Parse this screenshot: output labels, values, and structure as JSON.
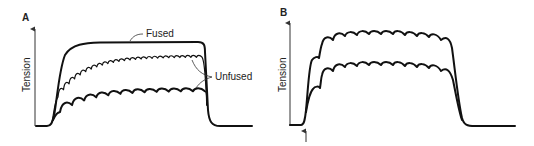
{
  "figure": {
    "panels": [
      {
        "id": "A",
        "label": "A",
        "ylabel": "Tension",
        "annotations": [
          "Fused",
          "Unfused"
        ]
      },
      {
        "id": "B",
        "label": "B",
        "ylabel": "Tension",
        "annotations": []
      }
    ]
  },
  "diagram": {
    "panelA": {
      "traces": [
        {
          "name": "Fused",
          "style": "thick",
          "ripple": "none",
          "relative_plateau": 1.0
        },
        {
          "name": "Unfused (upper)",
          "style": "thin",
          "ripple": "small",
          "relative_plateau": 0.8
        },
        {
          "name": "Unfused (lower)",
          "style": "thick",
          "ripple": "large",
          "relative_plateau": 0.42
        }
      ]
    },
    "panelB": {
      "traces": [
        {
          "name": "Upper",
          "style": "thick",
          "ripple": "medium",
          "relative_plateau": 1.0
        },
        {
          "name": "Lower",
          "style": "thick",
          "ripple": "medium",
          "relative_plateau": 0.65
        }
      ],
      "marker": "stimulus-onset-arrow"
    }
  }
}
